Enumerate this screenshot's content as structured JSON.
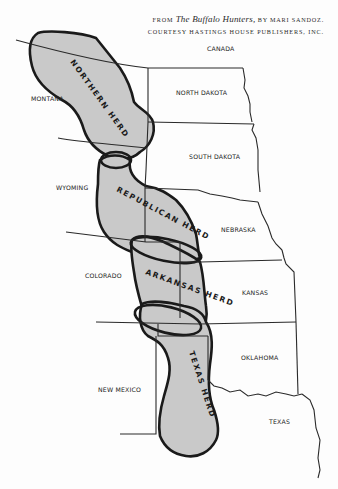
{
  "credit": {
    "from": "FROM",
    "book_title": "The Buffalo Hunters,",
    "by_author": "BY MARI SANDOZ.",
    "courtesy": "COURTESY HASTINGS HOUSE PUBLISHERS, INC."
  },
  "map": {
    "colors": {
      "herd_fill": "#c9c9c9",
      "herd_outline": "#1a1a1a",
      "border": "#2a2a2a",
      "background": "#fdfdfd"
    },
    "countries": [
      {
        "id": "canada",
        "label": "CANADA"
      }
    ],
    "states": [
      {
        "id": "montana",
        "label": "MONTANA"
      },
      {
        "id": "north-dakota",
        "label": "NORTH DAKOTA"
      },
      {
        "id": "south-dakota",
        "label": "SOUTH DAKOTA"
      },
      {
        "id": "wyoming",
        "label": "WYOMING"
      },
      {
        "id": "nebraska",
        "label": "NEBRASKA"
      },
      {
        "id": "colorado",
        "label": "COLORADO"
      },
      {
        "id": "kansas",
        "label": "KANSAS"
      },
      {
        "id": "oklahoma",
        "label": "OKLAHOMA"
      },
      {
        "id": "new-mexico",
        "label": "NEW MEXICO"
      },
      {
        "id": "texas",
        "label": "TEXAS"
      }
    ],
    "herds": [
      {
        "id": "northern",
        "label": "NORTHERN HERD"
      },
      {
        "id": "republican",
        "label": "REPUBLICAN HERD"
      },
      {
        "id": "arkansas",
        "label": "ARKANSAS HERD"
      },
      {
        "id": "texas",
        "label": "TEXAS HERD"
      }
    ]
  }
}
